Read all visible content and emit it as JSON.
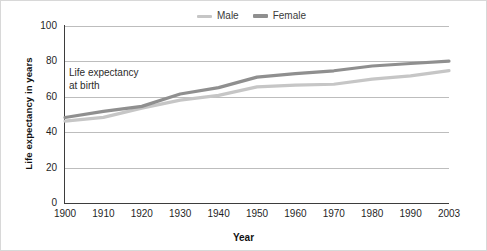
{
  "chart_data": {
    "type": "line",
    "title": "",
    "xlabel": "Year",
    "ylabel": "Life expectancy in years",
    "annotation": "Life expectancy\nat birth",
    "x": [
      1900,
      1910,
      1920,
      1930,
      1940,
      1950,
      1960,
      1970,
      1980,
      1990,
      2003
    ],
    "categories": [
      "1900",
      "1910",
      "1920",
      "1930",
      "1940",
      "1950",
      "1960",
      "1970",
      "1980",
      "1990",
      "2003"
    ],
    "xlim": [
      1900,
      2003
    ],
    "ylim": [
      0,
      100
    ],
    "yticks": [
      0,
      20,
      40,
      60,
      80,
      100
    ],
    "grid": true,
    "legend_position": "top-center",
    "series": [
      {
        "name": "Male",
        "color": "#c6c6c6",
        "values": [
          46.3,
          48.4,
          53.6,
          58.1,
          60.8,
          65.6,
          66.6,
          67.1,
          70.0,
          71.8,
          74.8
        ]
      },
      {
        "name": "Female",
        "color": "#8f8f8f",
        "values": [
          48.3,
          51.8,
          54.6,
          61.6,
          65.2,
          71.1,
          73.1,
          74.7,
          77.4,
          78.8,
          80.1
        ]
      }
    ]
  },
  "legend": {
    "items": [
      {
        "label": "Male",
        "color": "#c6c6c6"
      },
      {
        "label": "Female",
        "color": "#8f8f8f"
      }
    ]
  },
  "axes": {
    "y_title": "Life expectancy in years",
    "x_title": "Year",
    "y_ticks": [
      "100",
      "80",
      "60",
      "40",
      "20",
      "0"
    ],
    "x_ticks": [
      "1900",
      "1910",
      "1920",
      "1930",
      "1940",
      "1950",
      "1960",
      "1970",
      "1980",
      "1990",
      "2003"
    ]
  },
  "annotation": {
    "line1": "Life expectancy",
    "line2": "at birth"
  },
  "colors": {
    "male": "#c6c6c6",
    "female": "#8f8f8f",
    "grid": "#bdbdbd",
    "axis": "#3d3d3d",
    "text": "#1f1f1f",
    "background": "#ffffff"
  }
}
